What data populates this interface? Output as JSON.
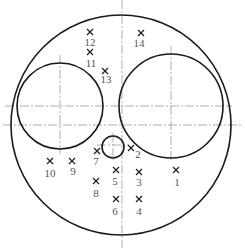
{
  "diagram": {
    "type": "cross-section layout",
    "outer_circle": {
      "cx": 121,
      "cy": 125,
      "r": 110
    },
    "left_circle": {
      "cx": 60,
      "cy": 106,
      "r": 43
    },
    "right_circle": {
      "cx": 171,
      "cy": 106,
      "r": 52
    },
    "small_circle": {
      "cx": 113,
      "cy": 147,
      "r": 11
    },
    "points": [
      {
        "id": "1",
        "label": "1",
        "x": 176,
        "y": 170,
        "lx": 177,
        "ly": 186
      },
      {
        "id": "2",
        "label": "2",
        "x": 131,
        "y": 148,
        "lx": 138,
        "ly": 158
      },
      {
        "id": "3",
        "label": "3",
        "x": 139,
        "y": 172,
        "lx": 139,
        "ly": 186
      },
      {
        "id": "4",
        "label": "4",
        "x": 139,
        "y": 199,
        "lx": 139,
        "ly": 215
      },
      {
        "id": "5",
        "label": "5",
        "x": 116,
        "y": 170,
        "lx": 115,
        "ly": 185
      },
      {
        "id": "6",
        "label": "6",
        "x": 116,
        "y": 199,
        "lx": 115,
        "ly": 215
      },
      {
        "id": "7",
        "label": "7",
        "x": 97,
        "y": 151,
        "lx": 96,
        "ly": 165
      },
      {
        "id": "8",
        "label": "8",
        "x": 96,
        "y": 181,
        "lx": 96,
        "ly": 197
      },
      {
        "id": "9",
        "label": "9",
        "x": 72,
        "y": 161,
        "lx": 73,
        "ly": 175
      },
      {
        "id": "10",
        "label": "10",
        "x": 50,
        "y": 161,
        "lx": 50,
        "ly": 177
      },
      {
        "id": "11",
        "label": "11",
        "x": 90,
        "y": 52,
        "lx": 91,
        "ly": 67
      },
      {
        "id": "12",
        "label": "12",
        "x": 90,
        "y": 32,
        "lx": 90,
        "ly": 46
      },
      {
        "id": "13",
        "label": "13",
        "x": 105,
        "y": 71,
        "lx": 106,
        "ly": 83
      },
      {
        "id": "14",
        "label": "14",
        "x": 141,
        "y": 33,
        "lx": 139,
        "ly": 47
      }
    ]
  }
}
